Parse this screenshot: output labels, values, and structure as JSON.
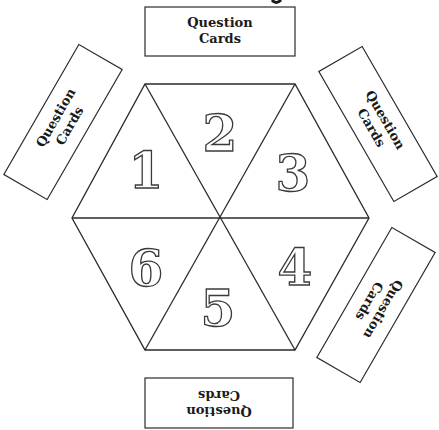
{
  "title_fragment": "g",
  "cards": [
    {
      "position": "top",
      "line1": "Question",
      "line2": "Cards",
      "rotation": 0
    },
    {
      "position": "upper-left",
      "line1": "Question",
      "line2": "Cards",
      "rotation": -60
    },
    {
      "position": "upper-right",
      "line1": "Question",
      "line2": "Cards",
      "rotation": 60
    },
    {
      "position": "lower-right",
      "line1": "Question",
      "line2": "Cards",
      "rotation": 120
    },
    {
      "position": "bottom",
      "line1": "Question",
      "line2": "Cards",
      "rotation": 180
    }
  ],
  "board": {
    "shape": "hexagon",
    "segments": [
      {
        "label": "1"
      },
      {
        "label": "2"
      },
      {
        "label": "3"
      },
      {
        "label": "4"
      },
      {
        "label": "5"
      },
      {
        "label": "6"
      }
    ]
  },
  "colors": {
    "line": "#2a2a2a",
    "background": "#ffffff"
  }
}
